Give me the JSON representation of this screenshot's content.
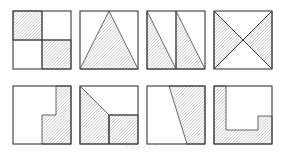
{
  "figure": {
    "caption": "Figure 1.3",
    "rows": 2,
    "columns": 4,
    "hatch": {
      "angle_degrees": 45,
      "spacing_px": 2.2,
      "line_color": "#6e6e6e",
      "line_width": 0.55
    },
    "outline_color": "#3a3a3a",
    "background_color": "#ffffff",
    "tile_size_px": 58,
    "tiles": [
      {
        "index": 1,
        "name": "checkerboard-quadrants",
        "description": "Square divided into four quadrants; top-left and bottom-right quadrants shaded.",
        "shaded_fraction": "1/2",
        "x": 12,
        "y": 10,
        "dividers": [
          [
            0,
            29,
            58,
            29
          ],
          [
            29,
            0,
            29,
            58
          ]
        ],
        "regions": [
          [
            [
              0,
              0
            ],
            [
              29,
              0
            ],
            [
              29,
              29
            ],
            [
              0,
              29
            ]
          ],
          [
            [
              29,
              29
            ],
            [
              58,
              29
            ],
            [
              58,
              58
            ],
            [
              29,
              58
            ]
          ]
        ]
      },
      {
        "index": 2,
        "name": "centered-triangle",
        "description": "Isosceles triangle with apex at top centre and base along the bottom edge, shaded.",
        "shaded_fraction": "1/2",
        "x": 79,
        "y": 10,
        "dividers": [],
        "regions": [
          [
            [
              29,
              0
            ],
            [
              58,
              58
            ],
            [
              0,
              58
            ]
          ]
        ]
      },
      {
        "index": 3,
        "name": "twin-right-triangles",
        "description": "Square split into two vertical halves; each half contains a right triangle shaded with the hypotenuse from top-left to bottom-right.",
        "shaded_fraction": "1/2",
        "x": 146,
        "y": 10,
        "dividers": [
          [
            29,
            0,
            29,
            58
          ]
        ],
        "regions": [
          [
            [
              0,
              0
            ],
            [
              29,
              58
            ],
            [
              0,
              58
            ]
          ],
          [
            [
              29,
              0
            ],
            [
              58,
              58
            ],
            [
              29,
              58
            ]
          ]
        ]
      },
      {
        "index": 4,
        "name": "bowtie-diagonals",
        "description": "Both diagonals drawn forming an X; the left and right triangles are shaded.",
        "shaded_fraction": "1/2",
        "x": 213,
        "y": 10,
        "dividers": [
          [
            0,
            0,
            58,
            58
          ],
          [
            58,
            0,
            0,
            58
          ]
        ],
        "regions": [
          [
            [
              0,
              0
            ],
            [
              29,
              29
            ],
            [
              0,
              58
            ]
          ],
          [
            [
              58,
              0
            ],
            [
              58,
              58
            ],
            [
              29,
              29
            ]
          ]
        ]
      },
      {
        "index": 5,
        "name": "staircase-right-block",
        "description": "Shaded region forms a step: a vertical strip along the right side plus a wider band across the lower right.",
        "shaded_fraction": "1/2",
        "x": 12,
        "y": 85,
        "dividers": [],
        "regions": [
          [
            [
              43,
              0
            ],
            [
              58,
              0
            ],
            [
              58,
              58
            ],
            [
              29,
              58
            ],
            [
              29,
              29
            ],
            [
              43,
              29
            ]
          ]
        ]
      },
      {
        "index": 6,
        "name": "diagonal-band-and-corner",
        "description": "A triangular wedge from the upper-left plus the lower-right quadrant are shaded, leaving a white notch at the lower left.",
        "shaded_fraction": "1/2",
        "x": 79,
        "y": 85,
        "dividers": [
          [
            29,
            29,
            58,
            29
          ],
          [
            29,
            29,
            29,
            58
          ]
        ],
        "regions": [
          [
            [
              0,
              0
            ],
            [
              29,
              29
            ],
            [
              29,
              58
            ],
            [
              0,
              58
            ]
          ],
          [
            [
              29,
              29
            ],
            [
              58,
              29
            ],
            [
              58,
              58
            ],
            [
              29,
              58
            ]
          ]
        ]
      },
      {
        "index": 7,
        "name": "slanted-trapezoid",
        "description": "A trapezoid on the right, bounded by a slanted line running from the top edge down to the bottom edge, shaded.",
        "shaded_fraction": "1/2",
        "x": 146,
        "y": 85,
        "dividers": [],
        "regions": [
          [
            [
              22,
              0
            ],
            [
              58,
              0
            ],
            [
              58,
              58
            ],
            [
              40,
              58
            ]
          ]
        ]
      },
      {
        "index": 8,
        "name": "notched-frame",
        "description": "Shaded border region: left strip and bottom strip plus a right-hand block below a step, enclosing a white rectangle.",
        "shaded_fraction": "1/2",
        "x": 213,
        "y": 85,
        "dividers": [],
        "regions": [
          [
            [
              0,
              0
            ],
            [
              12,
              0
            ],
            [
              12,
              44
            ],
            [
              44,
              44
            ],
            [
              44,
              30
            ],
            [
              58,
              30
            ],
            [
              58,
              58
            ],
            [
              0,
              58
            ]
          ]
        ]
      }
    ]
  }
}
